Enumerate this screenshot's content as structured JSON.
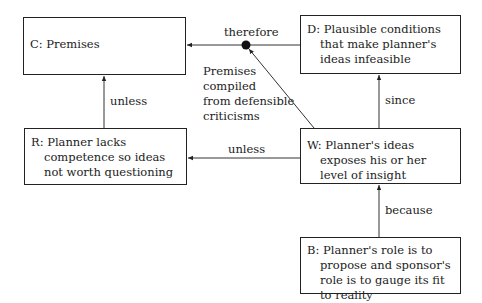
{
  "boxes": {
    "C": {
      "text": "C: Premises"
    },
    "D": {
      "text": "D: Plausible conditions that make planner's ideas infeasible"
    },
    "R": {
      "text": "R: Planner lacks competence so ideas not worth questioning"
    },
    "W": {
      "text": "W: Planner's ideas exposes his or her level of insight"
    },
    "B": {
      "text": "B: Planner's role is to propose and sponsor's role is to gauge its fit to reality"
    }
  },
  "labels": {
    "therefore": "therefore",
    "unless_c": "unless",
    "unless_w": "unless",
    "since": "since",
    "because": "because",
    "premises_note_1": "Premises",
    "premises_note_2": "compiled",
    "premises_note_3": "from defensible",
    "premises_note_4": "criticisms"
  }
}
